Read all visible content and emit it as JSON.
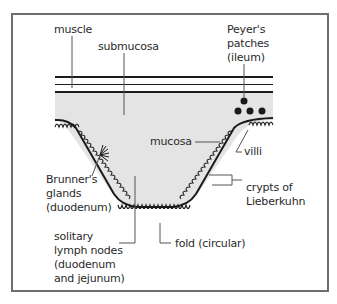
{
  "diagram": {
    "colors": {
      "frame": "#6e6e6e",
      "fill": "#e4e4e4",
      "line": "#1a1a1a",
      "text": "#2a2a2a"
    },
    "labels": {
      "muscle": "muscle",
      "submucosa": "submucosa",
      "peyers": "Peyer's\npatches\n(ileum)",
      "mucosa": "mucosa",
      "villi": "villi",
      "brunners": "Brunner's\nglands\n(duodenum)",
      "crypts": "crypts of\nLieberkuhn",
      "solitary": "solitary\nlymph nodes\n(duodenum\nand jejunum)",
      "fold": "fold (circular)"
    }
  }
}
